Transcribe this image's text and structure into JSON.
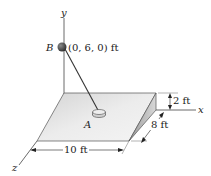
{
  "diagram": {
    "axes": {
      "x_label": "x",
      "y_label": "y",
      "z_label": "z"
    },
    "points": {
      "B": {
        "label": "B",
        "coord_text": "(0, 6, 0) ft"
      },
      "A": {
        "label": "A"
      }
    },
    "dimensions": {
      "height": "2 ft",
      "depth": "8 ft",
      "width": "10 ft"
    },
    "colors": {
      "plate_top": "#e2e2e2",
      "plate_side": "#c4c4c4",
      "sphere": "#555555",
      "line": "#333333"
    }
  }
}
